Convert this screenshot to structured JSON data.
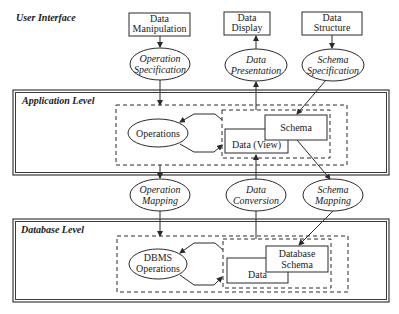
{
  "diagram": {
    "layers": {
      "user_interface": {
        "title": "User Interface"
      },
      "application": {
        "title": "Application Level"
      },
      "database": {
        "title": "Database Level"
      }
    },
    "ui_boxes": {
      "data_manipulation": {
        "line1": "Data",
        "line2": "Manipulation"
      },
      "data_display": {
        "line1": "Data",
        "line2": "Display"
      },
      "data_structure": {
        "line1": "Data",
        "line2": "Structure"
      }
    },
    "ui_processes": {
      "operation_specification": {
        "line1": "Operation",
        "line2": "Specification"
      },
      "data_presentation": {
        "line1": "Data",
        "line2": "Presentation"
      },
      "schema_specification": {
        "line1": "Schema",
        "line2": "Specification"
      }
    },
    "application_nodes": {
      "operations": "Operations",
      "schema": "Schema",
      "data_view": "Data (View)"
    },
    "mapping_processes": {
      "operation_mapping": {
        "line1": "Operation",
        "line2": "Mapping"
      },
      "data_conversion": {
        "line1": "Data",
        "line2": "Conversion"
      },
      "schema_mapping": {
        "line1": "Schema",
        "line2": "Mapping"
      }
    },
    "database_nodes": {
      "dbms_operations": {
        "line1": "DBMS",
        "line2": "Operations"
      },
      "database_schema": {
        "line1": "Database",
        "line2": "Schema"
      },
      "data": "Data"
    },
    "edges": [
      {
        "from": "Data Manipulation",
        "to": "Operation Specification"
      },
      {
        "from": "Operation Specification",
        "to": "Application Level"
      },
      {
        "from": "Application Level",
        "to": "Data Presentation"
      },
      {
        "from": "Data Presentation",
        "to": "Data Display"
      },
      {
        "from": "Data Structure",
        "to": "Schema Specification"
      },
      {
        "from": "Schema Specification",
        "to": "Schema"
      },
      {
        "from": "Application Level",
        "to": "Operation Mapping"
      },
      {
        "from": "Operation Mapping",
        "to": "Database Level"
      },
      {
        "from": "Data Conversion",
        "to": "Data (View)"
      },
      {
        "from": "Database Level",
        "to": "Data Conversion"
      },
      {
        "from": "Schema",
        "to": "Schema Mapping"
      },
      {
        "from": "Schema Mapping",
        "to": "Database Schema"
      },
      {
        "from": "Data (View)",
        "to": "Operations"
      },
      {
        "from": "Operations",
        "to": "Data (View)"
      },
      {
        "from": "Data",
        "to": "DBMS Operations"
      },
      {
        "from": "DBMS Operations",
        "to": "Data"
      }
    ]
  }
}
